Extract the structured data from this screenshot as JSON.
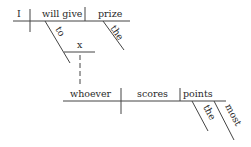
{
  "diagram": {
    "type": "Reed-Kellogg sentence diagram",
    "main_clause": {
      "subject": "I",
      "verb": "will give",
      "object": "prize",
      "object_modifier": "the",
      "verb_modifier_preposition": "to",
      "prepositional_object": "x"
    },
    "subordinate_clause": {
      "subject": "whoever",
      "verb": "scores",
      "object": "points",
      "object_modifiers": [
        "the",
        "most"
      ]
    }
  }
}
